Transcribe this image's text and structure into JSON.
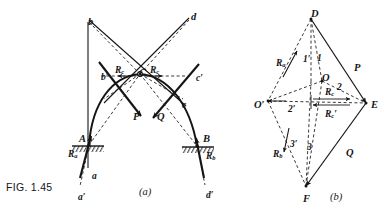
{
  "figure": {
    "number_label": "FIG. 1.45",
    "panels": [
      {
        "id": "a",
        "caption": "(a)"
      },
      {
        "id": "b",
        "caption": "(b)"
      }
    ]
  },
  "colors": {
    "ink": "#151515",
    "paper": "#ffffff"
  },
  "panel_a": {
    "description": "Three-hinged arch space diagram with applied loads P and Q and support reactions",
    "points": [
      {
        "name": "b",
        "label": "b",
        "x": 88,
        "y": 17,
        "size": "lg"
      },
      {
        "name": "d",
        "label": "d",
        "x": 191,
        "y": 12,
        "size": "lg"
      },
      {
        "name": "b-prime",
        "label": "b′",
        "x": 101,
        "y": 73,
        "size": "md"
      },
      {
        "name": "c-prime",
        "label": "c′",
        "x": 196,
        "y": 74,
        "size": "md"
      },
      {
        "name": "C",
        "label": "C",
        "x": 139,
        "y": 68,
        "size": "lg"
      },
      {
        "name": "c",
        "label": "c",
        "x": 182,
        "y": 101,
        "size": "md"
      },
      {
        "name": "A",
        "label": "A",
        "x": 79,
        "y": 134,
        "size": "lg"
      },
      {
        "name": "B",
        "label": "B",
        "x": 203,
        "y": 134,
        "size": "lg"
      },
      {
        "name": "a",
        "label": "a",
        "x": 92,
        "y": 172,
        "size": "md"
      },
      {
        "name": "a-prime",
        "label": "a′",
        "x": 78,
        "y": 193,
        "size": "md"
      },
      {
        "name": "d-prime",
        "label": "d′",
        "x": 206,
        "y": 191,
        "size": "md"
      }
    ],
    "force_labels": [
      {
        "name": "load-P",
        "label": "P",
        "x": 133,
        "y": 112,
        "size": "lg"
      },
      {
        "name": "load-Q",
        "label": "Q",
        "x": 157,
        "y": 112,
        "size": "lg"
      },
      {
        "name": "reaction-Ra",
        "label": "R",
        "sub": "a",
        "x": 68,
        "y": 150,
        "size": "md"
      },
      {
        "name": "reaction-Rb",
        "label": "R",
        "sub": "b",
        "x": 206,
        "y": 152,
        "size": "md"
      },
      {
        "name": "crown-thrust-left",
        "label": "R",
        "sub": "c",
        "x": 115,
        "y": 66,
        "size": "md"
      },
      {
        "name": "crown-thrust-right",
        "label": "R",
        "sub": "c",
        "x": 150,
        "y": 66,
        "size": "md"
      }
    ]
  },
  "panel_b": {
    "description": "Force polygon / vector diagram for the three-hinged arch",
    "points": [
      {
        "name": "D",
        "label": "D",
        "x": 311,
        "y": 9,
        "size": "lg"
      },
      {
        "name": "O",
        "label": "O",
        "x": 322,
        "y": 73,
        "size": "lg"
      },
      {
        "name": "O-prime",
        "label": "O′",
        "x": 254,
        "y": 100,
        "size": "lg"
      },
      {
        "name": "E",
        "label": "E",
        "x": 371,
        "y": 100,
        "size": "lg"
      },
      {
        "name": "F",
        "label": "F",
        "x": 303,
        "y": 194,
        "size": "lg"
      }
    ],
    "segment_labels": [
      {
        "name": "seg-1-prime",
        "label": "1′",
        "x": 303,
        "y": 55,
        "size": "md"
      },
      {
        "name": "seg-1",
        "label": "1",
        "x": 317,
        "y": 54,
        "size": "md"
      },
      {
        "name": "seg-2",
        "label": "2",
        "x": 337,
        "y": 83,
        "size": "md"
      },
      {
        "name": "seg-2-prime",
        "label": "2′",
        "x": 288,
        "y": 105,
        "size": "md"
      },
      {
        "name": "seg-3-prime",
        "label": "3′",
        "x": 290,
        "y": 140,
        "size": "md"
      },
      {
        "name": "seg-3",
        "label": "3",
        "x": 307,
        "y": 143,
        "size": "md"
      }
    ],
    "force_labels": [
      {
        "name": "reaction-Ra",
        "label": "R",
        "sub": "a",
        "x": 276,
        "y": 59,
        "size": "md"
      },
      {
        "name": "reaction-Rb",
        "label": "R",
        "sub": "b",
        "x": 273,
        "y": 150,
        "size": "md"
      },
      {
        "name": "load-P",
        "label": "P",
        "x": 354,
        "y": 63,
        "size": "lg"
      },
      {
        "name": "load-Q",
        "label": "Q",
        "x": 346,
        "y": 148,
        "size": "lg"
      },
      {
        "name": "crown-thrust-Rc",
        "label": "R",
        "sub": "c",
        "x": 325,
        "y": 88,
        "size": "md"
      },
      {
        "name": "crown-thrust-Rc-prime",
        "label": "R",
        "sub": "c",
        "prime": "′",
        "x": 325,
        "y": 110,
        "size": "md"
      }
    ]
  },
  "captions": {
    "a": {
      "text": "(a)",
      "x": 139,
      "y": 192
    },
    "b": {
      "text": "(b)",
      "x": 330,
      "y": 197
    }
  }
}
